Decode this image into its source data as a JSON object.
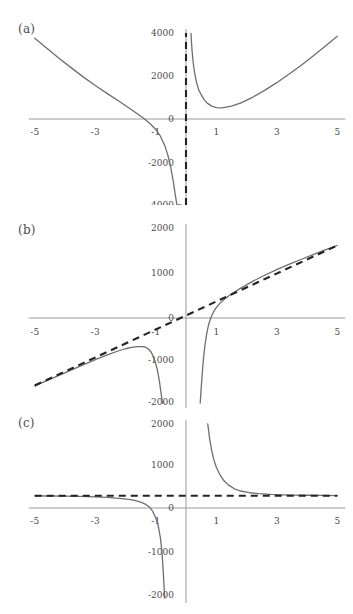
{
  "figure": {
    "title": "",
    "panels": [
      {
        "id": "a",
        "label": "(a)",
        "xlabels": [
          "-5",
          "-3",
          "-1",
          "1",
          "3",
          "5"
        ],
        "xvalues": [
          -5,
          -3,
          -1,
          1,
          3,
          5
        ],
        "zero_label": "0",
        "ylabels": [
          "4000",
          "2000",
          "0",
          "-2000",
          "-4000"
        ],
        "yvalues": [
          4000,
          2000,
          0,
          -2000,
          -4000
        ],
        "asymptote_kind": "vertical",
        "asymptote_label": "x = 0"
      },
      {
        "id": "b",
        "label": "(b)",
        "xlabels": [
          "-5",
          "-3",
          "-1",
          "1",
          "3",
          "5"
        ],
        "xvalues": [
          -5,
          -3,
          -1,
          1,
          3,
          5
        ],
        "zero_label": "0",
        "ylabels": [
          "2000",
          "1000",
          "0",
          "-1000",
          "-2000"
        ],
        "yvalues": [
          2000,
          1000,
          0,
          -1000,
          -2000
        ],
        "asymptote_kind": "slant",
        "asymptote_label": "y = 320x"
      },
      {
        "id": "c",
        "label": "(c)",
        "xlabels": [
          "-5",
          "-3",
          "-1",
          "1",
          "3",
          "5"
        ],
        "xvalues": [
          -5,
          -3,
          -1,
          1,
          3,
          5
        ],
        "zero_label": "0",
        "ylabels": [
          "2000",
          "1000",
          "0",
          "-1000",
          "-2000"
        ],
        "yvalues": [
          2000,
          1000,
          0,
          -1000,
          -2000
        ],
        "asymptote_kind": "horizontal",
        "asymptote_label": "y = 350"
      }
    ]
  },
  "colors": {
    "curve": "#6e6e6e",
    "asymptote": "#232323",
    "axis": "#9a9a9a",
    "text": "#4a4a4a",
    "background": "#ffffff"
  },
  "chart_data": [
    {
      "type": "line",
      "panel": "a",
      "title": "(a)",
      "xlabel": "",
      "ylabel": "",
      "xlim": [
        -5,
        5
      ],
      "ylim": [
        -4000,
        4000
      ],
      "xticks": [
        -5,
        -3,
        -1,
        0,
        1,
        3,
        5
      ],
      "yticks": [
        -4000,
        -2000,
        0,
        2000,
        4000
      ],
      "grid": false,
      "legend": "none",
      "annotations": [
        "vertical asymptote at x = 0 (dashed)"
      ],
      "series": [
        {
          "name": "left-branch",
          "x": [
            -5.0,
            -4.6,
            -4.2,
            -3.8,
            -3.4,
            -3.0,
            -2.6,
            -2.2,
            -1.8,
            -1.4,
            -1.2,
            -1.0,
            -0.85,
            -0.7,
            -0.6,
            -0.5,
            -0.42,
            -0.35,
            -0.3,
            -0.26,
            -0.23,
            -0.2,
            -0.175,
            -0.16
          ],
          "y": [
            3760,
            3290,
            2830,
            2390,
            1960,
            1560,
            1180,
            810,
            430,
            35,
            -200,
            -490,
            -790,
            -1240,
            -1680,
            -2280,
            -2900,
            -3560,
            -4000,
            -4000,
            -4000,
            -4000,
            -4000,
            -4000
          ]
        },
        {
          "name": "right-branch",
          "x": [
            0.165,
            0.18,
            0.2,
            0.23,
            0.26,
            0.3,
            0.35,
            0.42,
            0.5,
            0.6,
            0.7,
            0.85,
            1.0,
            1.2,
            1.5,
            1.8,
            2.2,
            2.6,
            3.0,
            3.4,
            3.8,
            4.2,
            4.6,
            5.0
          ],
          "y": [
            3980,
            3600,
            3180,
            2720,
            2380,
            2030,
            1690,
            1360,
            1130,
            900,
            740,
            600,
            530,
            520,
            600,
            740,
            1010,
            1330,
            1690,
            2080,
            2490,
            2930,
            3380,
            3850
          ]
        },
        {
          "name": "asymptote-vertical",
          "x": [
            0,
            0
          ],
          "y": [
            -4000,
            4000
          ],
          "dashed": true
        }
      ]
    },
    {
      "type": "line",
      "panel": "b",
      "title": "(b)",
      "xlabel": "",
      "ylabel": "",
      "xlim": [
        -5,
        5
      ],
      "ylim": [
        -2000,
        2000
      ],
      "xticks": [
        -5,
        -3,
        -1,
        0,
        1,
        3,
        5
      ],
      "yticks": [
        -2000,
        -1000,
        0,
        1000,
        2000
      ],
      "grid": false,
      "legend": "none",
      "annotations": [
        "slant asymptote y = 320x (dashed)",
        "vertical asymptote at x = 0"
      ],
      "series": [
        {
          "name": "left-branch",
          "x": [
            -5.0,
            -4.6,
            -4.2,
            -3.8,
            -3.4,
            -3.0,
            -2.6,
            -2.2,
            -2.0,
            -1.8,
            -1.6,
            -1.45,
            -1.35,
            -1.25,
            -1.15,
            -1.05,
            -0.95,
            -0.88,
            -0.82,
            -0.78,
            -0.75,
            -0.73
          ],
          "y": [
            -1610,
            -1490,
            -1370,
            -1250,
            -1130,
            -1010,
            -900,
            -800,
            -760,
            -730,
            -710,
            -710,
            -720,
            -760,
            -840,
            -980,
            -1230,
            -1500,
            -1790,
            -2000,
            -2000,
            -2000
          ]
        },
        {
          "name": "right-branch",
          "x": [
            0.47,
            0.5,
            0.54,
            0.58,
            0.62,
            0.68,
            0.74,
            0.82,
            0.9,
            1.0,
            1.15,
            1.3,
            1.5,
            1.8,
            2.2,
            2.6,
            3.0,
            3.4,
            3.8,
            4.2,
            4.6,
            5.0
          ],
          "y": [
            -2000,
            -1680,
            -1290,
            -970,
            -720,
            -430,
            -230,
            -50,
            70,
            180,
            300,
            390,
            490,
            620,
            780,
            920,
            1050,
            1170,
            1280,
            1390,
            1500,
            1600
          ]
        },
        {
          "name": "asymptote-slant",
          "x": [
            -5,
            5
          ],
          "y": [
            -1600,
            1600
          ],
          "dashed": true
        }
      ]
    },
    {
      "type": "line",
      "panel": "c",
      "title": "(c)",
      "xlabel": "",
      "ylabel": "",
      "xlim": [
        -5,
        5
      ],
      "ylim": [
        -2000,
        2000
      ],
      "xticks": [
        -5,
        -3,
        -1,
        0,
        1,
        3,
        5
      ],
      "yticks": [
        -2000,
        -1000,
        0,
        1000,
        2000
      ],
      "grid": false,
      "legend": "none",
      "annotations": [
        "horizontal asymptote y = 350 (dashed)",
        "vertical asymptote at x = 0"
      ],
      "series": [
        {
          "name": "left-branch",
          "x": [
            -5.0,
            -4.5,
            -4.0,
            -3.5,
            -3.0,
            -2.6,
            -2.2,
            -1.9,
            -1.7,
            -1.5,
            -1.35,
            -1.2,
            -1.1,
            -1.0,
            -0.92,
            -0.85,
            -0.8,
            -0.76,
            -0.72,
            -0.7
          ],
          "y": [
            348,
            345,
            340,
            334,
            324,
            312,
            292,
            268,
            244,
            205,
            160,
            85,
            -10,
            -160,
            -330,
            -600,
            -900,
            -1300,
            -1800,
            -2000
          ]
        },
        {
          "name": "right-branch",
          "x": [
            0.72,
            0.78,
            0.85,
            0.92,
            1.0,
            1.1,
            1.25,
            1.4,
            1.6,
            1.8,
            2.1,
            2.4,
            2.8,
            3.2,
            3.6,
            4.0,
            4.5,
            5.0
          ],
          "y": [
            2000,
            1670,
            1390,
            1180,
            1010,
            860,
            700,
            600,
            510,
            460,
            420,
            400,
            382,
            372,
            366,
            362,
            357,
            354
          ]
        },
        {
          "name": "asymptote-horizontal",
          "x": [
            -5,
            5
          ],
          "y": [
            350,
            350
          ],
          "dashed": true
        }
      ]
    }
  ]
}
